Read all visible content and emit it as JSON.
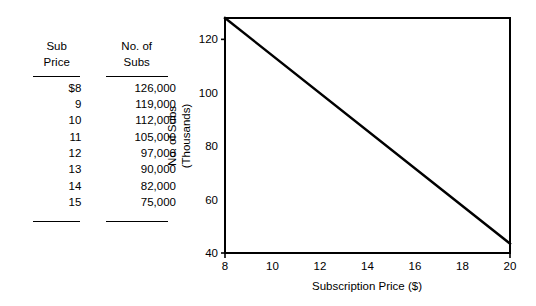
{
  "table": {
    "name": "subscription-demand-table",
    "headers": [
      {
        "line1": "Sub",
        "line2": "Price"
      },
      {
        "line1": "No. of",
        "line2": "Subs"
      }
    ],
    "rows": [
      {
        "price": "$8",
        "subs": "126,000"
      },
      {
        "price": "9",
        "subs": "119,000"
      },
      {
        "price": "10",
        "subs": "112,000"
      },
      {
        "price": "11",
        "subs": "105,000"
      },
      {
        "price": "12",
        "subs": "97,000"
      },
      {
        "price": "13",
        "subs": "90,000"
      },
      {
        "price": "14",
        "subs": "82,000"
      },
      {
        "price": "15",
        "subs": "75,000"
      }
    ]
  },
  "chart_data": {
    "type": "line",
    "title": "",
    "xlabel": "Subscription Price ($)",
    "ylabel_line1": "No. of Subs",
    "ylabel_line2": "(Thousands)",
    "xlim": [
      8,
      20
    ],
    "ylim": [
      40,
      128
    ],
    "xticks": [
      8,
      10,
      12,
      14,
      16,
      18,
      20
    ],
    "xtick_labels": [
      "8",
      "10",
      "12",
      "14",
      "16",
      "18",
      "20"
    ],
    "yticks": [
      40,
      60,
      80,
      100,
      120
    ],
    "ytick_labels": [
      "40",
      "60",
      "80",
      "100",
      "120"
    ],
    "grid": false,
    "legend": false,
    "series": [
      {
        "name": "Demand",
        "x": [
          8,
          20
        ],
        "values": [
          128,
          43.5
        ],
        "color": "#000000"
      }
    ],
    "source_points": {
      "x": [
        8,
        9,
        10,
        11,
        12,
        13,
        14,
        15
      ],
      "y": [
        126,
        119,
        112,
        105,
        97,
        90,
        82,
        75
      ]
    }
  },
  "colors": {
    "ink": "#000000",
    "background": "#ffffff"
  }
}
